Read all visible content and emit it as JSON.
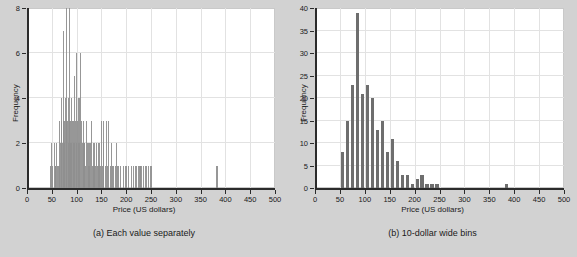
{
  "figure": {
    "background_color": "#d2d2d2",
    "bar_color": "#6e6e6e",
    "grid_color": "#e2e2e2",
    "axis_color": "#2b2b2b"
  },
  "panels": [
    {
      "id": "panel-a",
      "caption": "(a) Each value separately",
      "xlabel": "Price (US dollars)",
      "ylabel": "Frequency"
    },
    {
      "id": "panel-b",
      "caption": "(b) 10-dollar wide bins",
      "xlabel": "Price (US dollars)",
      "ylabel": "Frequency"
    }
  ],
  "chart_data": [
    {
      "type": "bar",
      "id": "panel-a",
      "title": "(a) Each value separately",
      "xlabel": "Price (US dollars)",
      "ylabel": "Frequency",
      "xlim": [
        0,
        500
      ],
      "ylim": [
        0,
        8
      ],
      "xticks": [
        0,
        50,
        100,
        150,
        200,
        250,
        300,
        350,
        400,
        450,
        500
      ],
      "yticks": [
        0,
        2,
        4,
        6,
        8
      ],
      "xticklabels": [
        "0",
        "50",
        "100",
        "150",
        "200",
        "250",
        "300",
        "350",
        "400",
        "450",
        "500"
      ],
      "yticklabels": [
        "0",
        "2",
        "4",
        "6",
        "8"
      ],
      "grid": true,
      "legend": false,
      "bin_width": 1,
      "note": "One spike per distinct price value; heights are counts of that exact price.",
      "x": [
        48,
        50,
        52,
        55,
        57,
        58,
        60,
        62,
        63,
        65,
        66,
        68,
        69,
        70,
        72,
        73,
        74,
        75,
        76,
        78,
        79,
        80,
        82,
        83,
        84,
        85,
        86,
        87,
        88,
        89,
        90,
        92,
        93,
        94,
        95,
        96,
        98,
        99,
        100,
        102,
        104,
        105,
        106,
        108,
        110,
        112,
        114,
        115,
        116,
        118,
        120,
        122,
        124,
        125,
        126,
        128,
        130,
        132,
        134,
        135,
        136,
        138,
        140,
        142,
        144,
        145,
        146,
        148,
        150,
        152,
        154,
        155,
        158,
        160,
        162,
        165,
        168,
        170,
        172,
        175,
        178,
        180,
        182,
        185,
        188,
        195,
        198,
        200,
        205,
        210,
        215,
        218,
        220,
        225,
        228,
        230,
        235,
        240,
        245,
        250,
        383
      ],
      "values": [
        1,
        2,
        1,
        2,
        1,
        1,
        2,
        1,
        1,
        3,
        1,
        2,
        3,
        4,
        2,
        3,
        7,
        3,
        2,
        4,
        3,
        8,
        3,
        4,
        2,
        3,
        8,
        2,
        3,
        2,
        4,
        3,
        2,
        3,
        5,
        2,
        3,
        2,
        6,
        3,
        2,
        4,
        2,
        6,
        3,
        2,
        3,
        2,
        2,
        1,
        3,
        2,
        1,
        2,
        1,
        2,
        3,
        1,
        2,
        1,
        2,
        1,
        2,
        1,
        1,
        2,
        1,
        1,
        3,
        1,
        2,
        3,
        1,
        3,
        1,
        3,
        1,
        2,
        1,
        1,
        1,
        2,
        1,
        1,
        1,
        1,
        1,
        1,
        1,
        1,
        1,
        1,
        1,
        1,
        1,
        1,
        1,
        1,
        1,
        1,
        1
      ]
    },
    {
      "type": "bar",
      "id": "panel-b",
      "title": "(b) 10-dollar wide bins",
      "xlabel": "Price (US dollars)",
      "ylabel": "Frequency",
      "xlim": [
        0,
        500
      ],
      "ylim": [
        0,
        40
      ],
      "xticks": [
        0,
        50,
        100,
        150,
        200,
        250,
        300,
        350,
        400,
        450,
        500
      ],
      "yticks": [
        0,
        5,
        10,
        15,
        20,
        25,
        30,
        35,
        40
      ],
      "xticklabels": [
        "0",
        "50",
        "100",
        "150",
        "200",
        "250",
        "300",
        "350",
        "400",
        "450",
        "500"
      ],
      "yticklabels": [
        "0",
        "5",
        "10",
        "15",
        "20",
        "25",
        "30",
        "35",
        "40"
      ],
      "grid": true,
      "legend": false,
      "bin_width": 10,
      "bin_starts": [
        50,
        60,
        70,
        80,
        90,
        100,
        110,
        120,
        130,
        140,
        150,
        160,
        170,
        180,
        190,
        200,
        210,
        220,
        230,
        240,
        380
      ],
      "values": [
        8,
        15,
        23,
        39,
        21,
        23,
        20,
        13,
        15,
        8,
        11,
        6,
        3,
        3,
        1,
        2,
        3,
        1,
        1,
        1,
        1
      ]
    }
  ]
}
